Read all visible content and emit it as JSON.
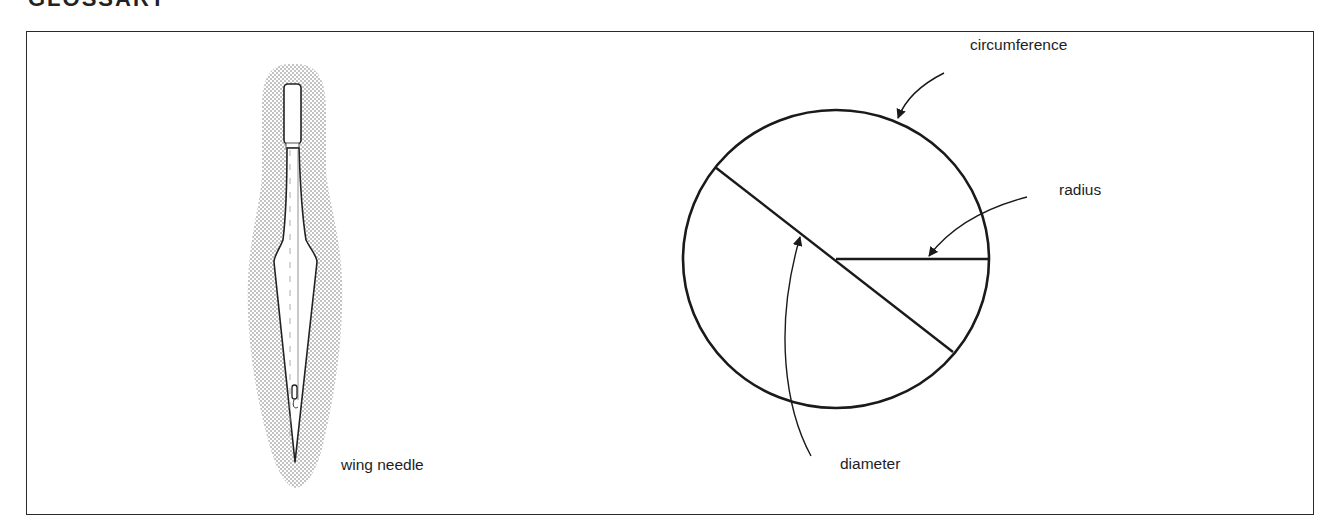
{
  "page": {
    "heading": "GLOSSARY"
  },
  "figure_left": {
    "label": "wing needle",
    "icon": "wing-needle-illustration"
  },
  "figure_right": {
    "labels": {
      "circumference": "circumference",
      "radius": "radius",
      "diameter": "diameter"
    },
    "icon": "circle-parts-diagram"
  }
}
